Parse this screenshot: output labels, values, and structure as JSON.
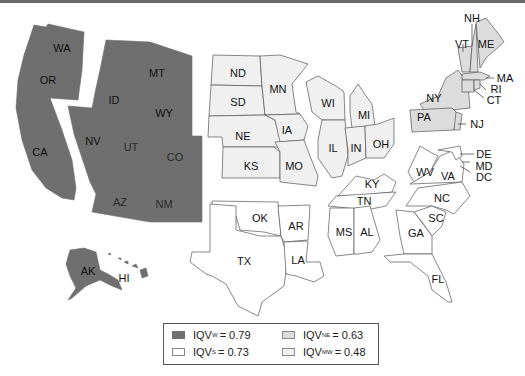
{
  "colors": {
    "west": "#6f6f6f",
    "south": "#ffffff",
    "northeast": "#dcdcdc",
    "midwest": "#f0f0f0",
    "border": "#555555"
  },
  "regions": {
    "west": {
      "name": "West",
      "states": [
        "WA",
        "OR",
        "CA",
        "ID",
        "MT",
        "WY",
        "NV",
        "UT",
        "CO",
        "AZ",
        "NM",
        "AK",
        "HI"
      ]
    },
    "midwest": {
      "name": "Midwest",
      "states": [
        "ND",
        "SD",
        "NE",
        "KS",
        "MN",
        "IA",
        "MO",
        "WI",
        "IL",
        "MI",
        "IN",
        "OH"
      ]
    },
    "south": {
      "name": "South",
      "states": [
        "OK",
        "TX",
        "AR",
        "LA",
        "KY",
        "TN",
        "MS",
        "AL",
        "WV",
        "VA",
        "NC",
        "SC",
        "GA",
        "FL",
        "DE",
        "MD",
        "DC"
      ]
    },
    "northeast": {
      "name": "Northeast",
      "states": [
        "NY",
        "PA",
        "NJ",
        "VT",
        "NH",
        "ME",
        "MA",
        "RI",
        "CT"
      ]
    }
  },
  "labels": {
    "WA": "WA",
    "OR": "OR",
    "CA": "CA",
    "ID": "ID",
    "MT": "MT",
    "WY": "WY",
    "NV": "NV",
    "UT": "UT",
    "CO": "CO",
    "AZ": "AZ",
    "NM": "NM",
    "AK": "AK",
    "HI": "HI",
    "ND": "ND",
    "SD": "SD",
    "NE": "NE",
    "KS": "KS",
    "MN": "MN",
    "IA": "IA",
    "MO": "MO",
    "WI": "WI",
    "IL": "IL",
    "MI": "MI",
    "IN": "IN",
    "OH": "OH",
    "OK": "OK",
    "TX": "TX",
    "AR": "AR",
    "LA": "LA",
    "KY": "KY",
    "TN": "TN",
    "MS": "MS",
    "AL": "AL",
    "WV": "WV",
    "VA": "VA",
    "NC": "NC",
    "SC": "SC",
    "GA": "GA",
    "FL": "FL",
    "DE": "DE",
    "MD": "MD",
    "DC": "DC",
    "NY": "NY",
    "PA": "PA",
    "NJ": "NJ",
    "VT": "VT",
    "NH": "NH",
    "ME": "ME",
    "MA": "MA",
    "RI": "RI",
    "CT": "CT"
  },
  "legend": {
    "items": [
      {
        "prefix": "IQV",
        "subscript": "W",
        "value": "= 0.79",
        "color": "#6f6f6f"
      },
      {
        "prefix": "IQV",
        "subscript": "NE",
        "value": "= 0.63",
        "color": "#dcdcdc"
      },
      {
        "prefix": "IQV",
        "subscript": "S",
        "value": "= 0.73",
        "color": "#ffffff"
      },
      {
        "prefix": "IQV",
        "subscript": "MW",
        "value": "= 0.48",
        "color": "#f0f0f0"
      }
    ]
  }
}
